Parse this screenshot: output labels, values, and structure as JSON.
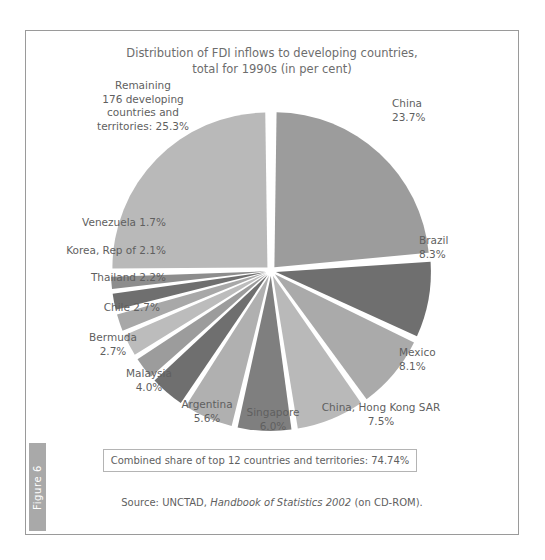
{
  "figure": {
    "tab_label": "Figure 6"
  },
  "chart_title_line1": "Distribution of FDI inflows to developing countries,",
  "chart_title_line2": "total for 1990s (in per cent)",
  "combined_share": "Combined share of top 12 countries and territories: 74.74%",
  "source": {
    "prefix": "Source: UNCTAD, ",
    "italic": "Handbook of Statistics 2002",
    "suffix": " (on CD-ROM)."
  },
  "labels": {
    "remaining": "Remaining\n176 developing\ncountries and\nterritories: 25.3%",
    "china": "China\n23.7%",
    "brazil": "Brazil\n8.3%",
    "mexico": "Mexico\n8.1%",
    "hongkong": "China, Hong Kong SAR\n7.5%",
    "singapore": "Singapore\n6.0%",
    "argentina": "Argentina\n5.6%",
    "malaysia": "Malaysia\n4.0%",
    "bermuda": "Bermuda\n2.7%",
    "chile": "Chile 2.7%",
    "thailand": "Thailand 2.2%",
    "korea": "Korea, Rep of 2.1%",
    "venezuela": "Venezuela 1.7%"
  },
  "colors": {
    "light": "#b9b9b9",
    "medium": "#9c9c9c",
    "dark": "#6f6f6f",
    "mid_light": "#aaaaaa",
    "mid_dark": "#7f7f7f",
    "text": "#5f5f5f",
    "frame": "#9a9a9a",
    "tab_bg": "#a9a9a9"
  },
  "chart_data": {
    "type": "pie",
    "title": "Distribution of FDI inflows to developing countries, total for 1990s (in per cent)",
    "unit": "per cent",
    "exploded": true,
    "start_angle_deg": 0,
    "direction": "clockwise",
    "legend": "none (direct labels)",
    "categories": [
      "China",
      "Brazil",
      "Mexico",
      "China, Hong Kong SAR",
      "Singapore",
      "Argentina",
      "Malaysia",
      "Bermuda",
      "Chile",
      "Thailand",
      "Korea, Rep of",
      "Venezuela",
      "Remaining 176 developing countries and territories"
    ],
    "values": [
      23.7,
      8.3,
      8.1,
      7.5,
      6.0,
      5.6,
      4.0,
      2.7,
      2.7,
      2.2,
      2.1,
      1.7,
      25.3
    ],
    "slice_colors": [
      "#9c9c9c",
      "#6f6f6f",
      "#aaaaaa",
      "#b9b9b9",
      "#7f7f7f",
      "#b0b0b0",
      "#6f6f6f",
      "#9c9c9c",
      "#bcbcbc",
      "#a8a8a8",
      "#6f6f6f",
      "#8d8d8d",
      "#b9b9b9"
    ],
    "annotations": [
      "Combined share of top 12 countries and territories: 74.74%"
    ],
    "source": "Source: UNCTAD, Handbook of Statistics 2002 (on CD-ROM)."
  }
}
